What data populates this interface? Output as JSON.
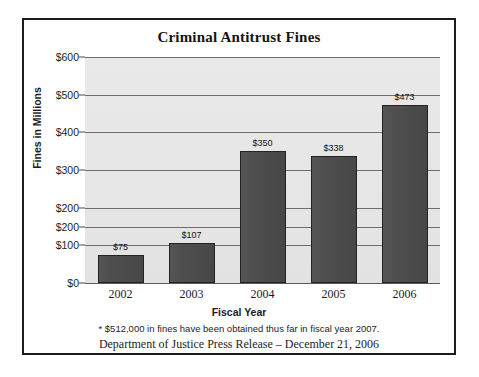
{
  "chart_data": {
    "type": "bar",
    "title": "Criminal Antitrust Fines",
    "xlabel": "Fiscal Year",
    "ylabel": "Fines in Millions",
    "categories": [
      "2002",
      "2003",
      "2004",
      "2005",
      "2006"
    ],
    "values": [
      75,
      107,
      350,
      338,
      473
    ],
    "value_labels": [
      "$75",
      "$107",
      "$350",
      "$338",
      "$473"
    ],
    "ylim": [
      0,
      600
    ],
    "ytick_values": [
      600,
      500,
      400,
      300,
      200,
      200,
      100,
      0
    ],
    "ytick_labels": [
      "$600",
      "$500",
      "$400",
      "$300",
      "$200",
      "$200",
      "$100",
      "$0"
    ],
    "ytick_positions": [
      600,
      500,
      400,
      300,
      200,
      150,
      100,
      0
    ],
    "grid": true,
    "legend": null,
    "plot_background": "#e7e7e7",
    "bar_color": "#4a4a4a",
    "bar_border_color": "#232323",
    "frame_color": "#1c1c1c",
    "annotations": [
      "* $512,000 in fines have been obtained thus far in fiscal year 2007.",
      "Department of Justice Press Release – December 21, 2006"
    ]
  },
  "footnotes": {
    "line1": "* $512,000 in fines have been obtained thus far in fiscal year 2007.",
    "line2": "Department of Justice Press Release – December 21, 2006"
  }
}
